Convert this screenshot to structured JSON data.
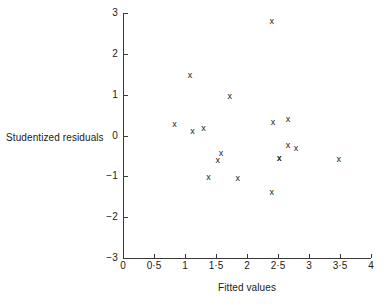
{
  "chart_data": {
    "type": "scatter",
    "title": "",
    "xlabel": "Fitted values",
    "ylabel": "Studentized residuals",
    "xlim": [
      0,
      4
    ],
    "ylim": [
      -3,
      3
    ],
    "grid": false,
    "legend": null,
    "marker": "x",
    "marker_color": "#222222",
    "axis_color": "#3a3a3a",
    "xticks": [
      {
        "value": 0,
        "label": "0"
      },
      {
        "value": 0.5,
        "label": "0·5"
      },
      {
        "value": 1,
        "label": "1"
      },
      {
        "value": 1.5,
        "label": "1·5"
      },
      {
        "value": 2,
        "label": "2"
      },
      {
        "value": 2.5,
        "label": "2·5"
      },
      {
        "value": 3,
        "label": "3"
      },
      {
        "value": 3.5,
        "label": "3·5"
      },
      {
        "value": 4,
        "label": "4"
      }
    ],
    "yticks": [
      {
        "value": 3,
        "label": "3"
      },
      {
        "value": 2,
        "label": "2"
      },
      {
        "value": 1,
        "label": "1"
      },
      {
        "value": 0,
        "label": "0"
      },
      {
        "value": -1,
        "label": "−1"
      },
      {
        "value": -2,
        "label": "−2"
      },
      {
        "value": -3,
        "label": "−3"
      }
    ],
    "points": [
      {
        "x": 0.83,
        "y": 0.27
      },
      {
        "x": 1.08,
        "y": 1.47
      },
      {
        "x": 1.12,
        "y": 0.09
      },
      {
        "x": 1.3,
        "y": 0.16
      },
      {
        "x": 1.38,
        "y": -1.04
      },
      {
        "x": 1.53,
        "y": -0.61
      },
      {
        "x": 1.58,
        "y": -0.45
      },
      {
        "x": 1.72,
        "y": 0.95
      },
      {
        "x": 1.85,
        "y": -1.06
      },
      {
        "x": 2.4,
        "y": 2.78
      },
      {
        "x": 2.42,
        "y": 0.33
      },
      {
        "x": 2.4,
        "y": -1.4
      },
      {
        "x": 2.66,
        "y": 0.4
      },
      {
        "x": 2.52,
        "y": -0.56
      },
      {
        "x": 2.66,
        "y": -0.24
      },
      {
        "x": 2.79,
        "y": -0.32
      },
      {
        "x": 3.48,
        "y": -0.58
      },
      {
        "x": 2.52,
        "y": -0.56
      }
    ]
  }
}
